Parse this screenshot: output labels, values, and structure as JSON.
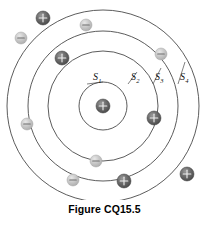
{
  "figure": {
    "caption": "Figure CQ15.5"
  },
  "colors": {
    "shell_stroke": "#4a4a4a",
    "positive_particle_dark": "#6b6b6b",
    "positive_particle_edge": "#3d3d3d",
    "negative_particle_light": "#c9c9c9",
    "negative_particle_edge": "#a6a6a6",
    "nucleus": "#6b6b6b",
    "label_text": "#111111",
    "caption_text": "#000000",
    "background": "#ffffff",
    "leader_line": "#4a4a4a"
  },
  "diagram": {
    "center": {
      "x": 103,
      "y": 106
    },
    "shells": [
      {
        "name": "S1",
        "label": "S",
        "subscript": "1",
        "radius": 24,
        "label_x": 93,
        "label_y": 80,
        "leader_from_x": 87,
        "leader_from_y": 84,
        "leader_to_x": 103,
        "leader_to_y": 82
      },
      {
        "name": "S2",
        "label": "S",
        "subscript": "2",
        "radius": 55,
        "label_x": 131,
        "label_y": 80,
        "leader_from_x": 128,
        "leader_from_y": 84,
        "leader_to_x": 137,
        "leader_to_y": 72
      },
      {
        "name": "S3",
        "label": "S",
        "subscript": "3",
        "radius": 75,
        "label_x": 155,
        "label_y": 80,
        "leader_from_x": 153,
        "leader_from_y": 84,
        "leader_to_x": 161,
        "leader_to_y": 68
      },
      {
        "name": "S4",
        "label": "S",
        "subscript": "4",
        "radius": 96,
        "label_x": 180,
        "label_y": 80,
        "leader_from_x": 178,
        "leader_from_y": 84,
        "leader_to_x": 185,
        "leader_to_y": 62
      }
    ],
    "nucleus": {
      "charge": "+",
      "x": 103,
      "y": 106,
      "r": 7
    },
    "particles": [
      {
        "charge": "+",
        "x": 43,
        "y": 18,
        "r": 7
      },
      {
        "charge": "-",
        "x": 86,
        "y": 25,
        "r": 6
      },
      {
        "charge": "-",
        "x": 21,
        "y": 38,
        "r": 6
      },
      {
        "charge": "-",
        "x": 161,
        "y": 54,
        "r": 6
      },
      {
        "charge": "+",
        "x": 62,
        "y": 58,
        "r": 7
      },
      {
        "charge": "-",
        "x": 27,
        "y": 124,
        "r": 6
      },
      {
        "charge": "+",
        "x": 154,
        "y": 118,
        "r": 7
      },
      {
        "charge": "-",
        "x": 96,
        "y": 161,
        "r": 6
      },
      {
        "charge": "-",
        "x": 73,
        "y": 180,
        "r": 6
      },
      {
        "charge": "+",
        "x": 124,
        "y": 181,
        "r": 7
      },
      {
        "charge": "+",
        "x": 187,
        "y": 174,
        "r": 7
      }
    ]
  }
}
